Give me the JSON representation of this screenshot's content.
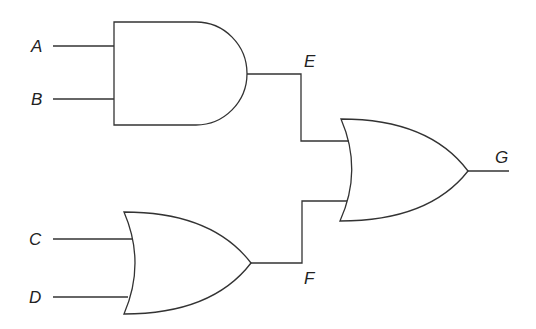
{
  "diagram": {
    "type": "logic-circuit",
    "colors": {
      "stroke": "#333333",
      "background": "#ffffff",
      "text": "#222222"
    },
    "inputs": [
      {
        "id": "A",
        "label": "A"
      },
      {
        "id": "B",
        "label": "B"
      },
      {
        "id": "C",
        "label": "C"
      },
      {
        "id": "D",
        "label": "D"
      }
    ],
    "gates": [
      {
        "id": "and1",
        "kind": "AND",
        "inputs": [
          "A",
          "B"
        ],
        "output": "E"
      },
      {
        "id": "or1",
        "kind": "OR",
        "inputs": [
          "C",
          "D"
        ],
        "output": "F"
      },
      {
        "id": "or2",
        "kind": "OR",
        "inputs": [
          "E",
          "F"
        ],
        "output": "G"
      }
    ],
    "nodes": [
      {
        "id": "E",
        "label": "E"
      },
      {
        "id": "F",
        "label": "F"
      }
    ],
    "output": {
      "id": "G",
      "label": "G"
    }
  }
}
